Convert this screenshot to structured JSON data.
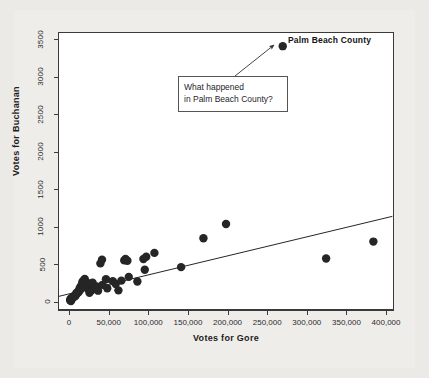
{
  "chart_data": {
    "type": "scatter",
    "title": "",
    "xlabel": "Votes for Gore",
    "ylabel": "Votes for Buchanan",
    "xlim": [
      -14000,
      410000
    ],
    "ylim": [
      -110,
      3600
    ],
    "grid": false,
    "legend": "none",
    "xticks": [
      0,
      50000,
      100000,
      150000,
      200000,
      250000,
      300000,
      350000,
      400000
    ],
    "xticklabels": [
      "0",
      "50,000",
      "100,000",
      "150,000",
      "200,000",
      "250,000",
      "300,000",
      "350,000",
      "400,000"
    ],
    "yticks": [
      0,
      500,
      1000,
      1500,
      2000,
      2500,
      3000,
      3500
    ],
    "yticklabels": [
      "0",
      "500",
      "1000",
      "1500",
      "2000",
      "2500",
      "3000",
      "3500"
    ],
    "marker_color": "#262626",
    "marker_size": 4.2,
    "line_color": "#262626",
    "trendline": {
      "name": "regression line",
      "x": [
        -13000,
        408000
      ],
      "y": [
        72,
        1140
      ]
    },
    "series": [
      {
        "name": "Florida counties",
        "points": [
          {
            "x": 2392,
            "y": 9
          },
          {
            "x": 3038,
            "y": 29
          },
          {
            "x": 2647,
            "y": 35
          },
          {
            "x": 1399,
            "y": 19
          },
          {
            "x": 1407,
            "y": 22
          },
          {
            "x": 2078,
            "y": 39
          },
          {
            "x": 3072,
            "y": 52
          },
          {
            "x": 4983,
            "y": 65
          },
          {
            "x": 5637,
            "y": 61
          },
          {
            "x": 6443,
            "y": 75
          },
          {
            "x": 7609,
            "y": 90
          },
          {
            "x": 8072,
            "y": 78
          },
          {
            "x": 9138,
            "y": 104
          },
          {
            "x": 9467,
            "y": 120
          },
          {
            "x": 10609,
            "y": 115
          },
          {
            "x": 11810,
            "y": 145
          },
          {
            "x": 12126,
            "y": 129
          },
          {
            "x": 13373,
            "y": 182
          },
          {
            "x": 14167,
            "y": 160
          },
          {
            "x": 14632,
            "y": 195
          },
          {
            "x": 15196,
            "y": 215
          },
          {
            "x": 16619,
            "y": 248
          },
          {
            "x": 17105,
            "y": 270
          },
          {
            "x": 18850,
            "y": 290
          },
          {
            "x": 19769,
            "y": 305
          },
          {
            "x": 20196,
            "y": 270
          },
          {
            "x": 21188,
            "y": 255
          },
          {
            "x": 22450,
            "y": 182
          },
          {
            "x": 23983,
            "y": 248
          },
          {
            "x": 24848,
            "y": 160
          },
          {
            "x": 25726,
            "y": 120
          },
          {
            "x": 26420,
            "y": 205
          },
          {
            "x": 27365,
            "y": 238
          },
          {
            "x": 28247,
            "y": 152
          },
          {
            "x": 29641,
            "y": 255
          },
          {
            "x": 31100,
            "y": 190
          },
          {
            "x": 33279,
            "y": 172
          },
          {
            "x": 34728,
            "y": 205
          },
          {
            "x": 36571,
            "y": 148
          },
          {
            "x": 39497,
            "y": 512
          },
          {
            "x": 41559,
            "y": 562
          },
          {
            "x": 41976,
            "y": 225
          },
          {
            "x": 46555,
            "y": 300
          },
          {
            "x": 48118,
            "y": 180
          },
          {
            "x": 55118,
            "y": 275
          },
          {
            "x": 58816,
            "y": 238
          },
          {
            "x": 62255,
            "y": 152
          },
          {
            "x": 65962,
            "y": 282
          },
          {
            "x": 69566,
            "y": 552
          },
          {
            "x": 71179,
            "y": 570
          },
          {
            "x": 73560,
            "y": 548
          },
          {
            "x": 75293,
            "y": 332
          },
          {
            "x": 86164,
            "y": 270
          },
          {
            "x": 93800,
            "y": 570
          },
          {
            "x": 95505,
            "y": 428
          },
          {
            "x": 97318,
            "y": 600
          },
          {
            "x": 107680,
            "y": 652
          },
          {
            "x": 141336,
            "y": 462
          },
          {
            "x": 169529,
            "y": 848
          },
          {
            "x": 198028,
            "y": 1038
          },
          {
            "x": 269613,
            "y": 3411,
            "label": "Palm Beach County"
          },
          {
            "x": 324344,
            "y": 577
          },
          {
            "x": 383979,
            "y": 803
          }
        ]
      }
    ],
    "annotations": [
      {
        "name": "palm-beach-callout",
        "lines": [
          "What happened",
          "in Palm Beach County?"
        ],
        "target_point": {
          "x": 269613,
          "y": 3411
        }
      },
      {
        "name": "palm-beach-point-label",
        "text": "Palm Beach County"
      }
    ]
  },
  "chart": {
    "xlabel": "Votes for Gore",
    "ylabel": "Votes for Buchanan",
    "point_label": "Palm Beach County",
    "annotation_line_1": "What happened",
    "annotation_line_2": "in Palm Beach County?",
    "xticklabels": [
      "0",
      "50,000",
      "100,000",
      "150,000",
      "200,000",
      "250,000",
      "300,000",
      "350,000",
      "400,000"
    ],
    "yticklabels": [
      "0",
      "500",
      "1000",
      "1500",
      "2000",
      "2500",
      "3000",
      "3500"
    ]
  }
}
